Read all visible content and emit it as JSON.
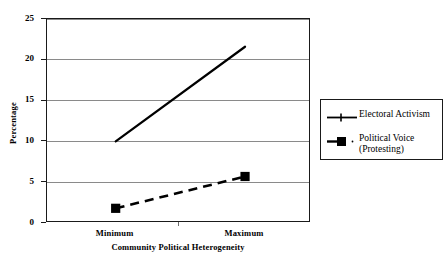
{
  "chart_data": {
    "type": "line",
    "title": "",
    "xlabel": "Community Political Heterogeneity",
    "ylabel": "Percentage",
    "categories": [
      "Minimum",
      "Maximum"
    ],
    "ylim": [
      0,
      25
    ],
    "yticks": [
      0,
      5,
      10,
      15,
      20,
      25
    ],
    "xlim_categories": 2,
    "grid": true,
    "grid_axis": "y",
    "legend_position": "right",
    "series": [
      {
        "name": "Electoral Activism",
        "values": [
          10.0,
          21.6
        ],
        "line_style": "solid",
        "color": "#000000",
        "marker": "none",
        "line_width": 2.2
      },
      {
        "name": "Political Voice (Protesting)",
        "values": [
          1.8,
          5.7
        ],
        "line_style": "dashed",
        "color": "#000000",
        "marker": "square",
        "line_width": 2.6
      }
    ]
  },
  "axes": {
    "y_title": "Percentage",
    "x_title": "Community Political Heterogeneity",
    "y_tick_labels": [
      "0",
      "5",
      "10",
      "15",
      "20",
      "25"
    ],
    "x_tick_labels": [
      "Minimum",
      "Maximum"
    ]
  },
  "legend": {
    "entries": [
      {
        "label": "Electoral Activism",
        "key": "solid-line-key"
      },
      {
        "label": "Political Voice\n(Protesting)",
        "key": "dashed-square-key"
      }
    ]
  },
  "colors": {
    "series": "#000000",
    "gridline": "#8a8a8a",
    "frame": "#1a1a1a",
    "background": "#ffffff"
  }
}
